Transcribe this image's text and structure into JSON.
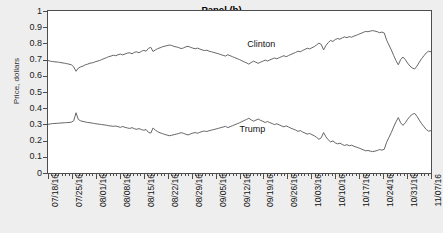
{
  "figure": {
    "panel_title": "Panel (b)",
    "ylabel": "Price, dollars",
    "background_color": "#eeeeee",
    "plot_background_color": "#ffffff",
    "line_color": "#666666",
    "frame_color": "#4d4d4d"
  },
  "chart_data": {
    "type": "line",
    "title": "Panel (b)",
    "xlabel": "",
    "ylabel": "Price, dollars",
    "ylim": [
      0,
      1
    ],
    "yticks": [
      0,
      0.1,
      0.2,
      0.3,
      0.4,
      0.5,
      0.6,
      0.7,
      0.8,
      0.9,
      1
    ],
    "ytick_labels": [
      "0",
      "0.1",
      "0.2",
      "0.3",
      "0.4",
      "0.5",
      "0.6",
      "0.7",
      "0.8",
      "0.9",
      "1"
    ],
    "grid": false,
    "legend_position": "inline-annotation",
    "xtick_labels": [
      "07/18/16",
      "07/25/16",
      "08/01/16",
      "08/08/16",
      "08/15/16",
      "08/22/16",
      "08/29/16",
      "09/05/16",
      "09/12/16",
      "09/19/16",
      "09/26/16",
      "10/03/16",
      "10/10/16",
      "10/17/16",
      "10/24/16",
      "10/31/16",
      "11/07/16"
    ],
    "x_start": "07/18/16",
    "x_end": "11/07/16",
    "x_interval": "daily (ticks), weekly (labels)",
    "series": [
      {
        "name": "Clinton",
        "label_x_frac": 0.52,
        "label_y_value": 0.795,
        "values": [
          0.695,
          0.69,
          0.688,
          0.686,
          0.685,
          0.683,
          0.68,
          0.678,
          0.675,
          0.672,
          0.668,
          0.655,
          0.628,
          0.648,
          0.655,
          0.66,
          0.668,
          0.672,
          0.678,
          0.68,
          0.685,
          0.69,
          0.694,
          0.7,
          0.706,
          0.712,
          0.718,
          0.722,
          0.727,
          0.724,
          0.73,
          0.734,
          0.729,
          0.735,
          0.74,
          0.742,
          0.736,
          0.745,
          0.748,
          0.742,
          0.751,
          0.757,
          0.752,
          0.769,
          0.776,
          0.75,
          0.76,
          0.768,
          0.773,
          0.779,
          0.783,
          0.786,
          0.79,
          0.787,
          0.781,
          0.778,
          0.774,
          0.768,
          0.772,
          0.779,
          0.782,
          0.776,
          0.771,
          0.767,
          0.771,
          0.765,
          0.76,
          0.756,
          0.758,
          0.752,
          0.748,
          0.744,
          0.74,
          0.736,
          0.731,
          0.726,
          0.722,
          0.73,
          0.724,
          0.718,
          0.712,
          0.706,
          0.7,
          0.693,
          0.686,
          0.68,
          0.672,
          0.682,
          0.69,
          0.684,
          0.677,
          0.684,
          0.69,
          0.697,
          0.691,
          0.698,
          0.704,
          0.71,
          0.705,
          0.712,
          0.718,
          0.724,
          0.718,
          0.725,
          0.732,
          0.738,
          0.744,
          0.752,
          0.748,
          0.756,
          0.763,
          0.77,
          0.766,
          0.773,
          0.78,
          0.79,
          0.802,
          0.793,
          0.76,
          0.787,
          0.805,
          0.818,
          0.812,
          0.824,
          0.83,
          0.826,
          0.834,
          0.84,
          0.835,
          0.842,
          0.838,
          0.845,
          0.85,
          0.856,
          0.862,
          0.868,
          0.874,
          0.872,
          0.876,
          0.879,
          0.876,
          0.872,
          0.866,
          0.87,
          0.864,
          0.82,
          0.79,
          0.76,
          0.726,
          0.694,
          0.668,
          0.7,
          0.716,
          0.7,
          0.678,
          0.66,
          0.648,
          0.642,
          0.66,
          0.684,
          0.706,
          0.724,
          0.742,
          0.752,
          0.748
        ]
      },
      {
        "name": "Trump",
        "label_x_frac": 0.5,
        "label_y_value": 0.272,
        "values": [
          0.3,
          0.303,
          0.305,
          0.306,
          0.307,
          0.308,
          0.309,
          0.31,
          0.311,
          0.312,
          0.314,
          0.322,
          0.372,
          0.33,
          0.322,
          0.318,
          0.315,
          0.312,
          0.31,
          0.308,
          0.305,
          0.303,
          0.301,
          0.299,
          0.297,
          0.295,
          0.292,
          0.29,
          0.288,
          0.29,
          0.286,
          0.282,
          0.287,
          0.282,
          0.278,
          0.275,
          0.28,
          0.273,
          0.27,
          0.274,
          0.268,
          0.264,
          0.268,
          0.251,
          0.246,
          0.278,
          0.264,
          0.255,
          0.248,
          0.243,
          0.238,
          0.234,
          0.23,
          0.233,
          0.237,
          0.24,
          0.244,
          0.249,
          0.245,
          0.239,
          0.235,
          0.241,
          0.246,
          0.25,
          0.245,
          0.251,
          0.256,
          0.259,
          0.256,
          0.261,
          0.265,
          0.268,
          0.272,
          0.276,
          0.28,
          0.284,
          0.288,
          0.28,
          0.286,
          0.292,
          0.298,
          0.304,
          0.31,
          0.317,
          0.324,
          0.33,
          0.338,
          0.328,
          0.32,
          0.326,
          0.333,
          0.325,
          0.319,
          0.312,
          0.318,
          0.311,
          0.305,
          0.299,
          0.304,
          0.297,
          0.291,
          0.285,
          0.291,
          0.284,
          0.277,
          0.271,
          0.265,
          0.257,
          0.262,
          0.253,
          0.247,
          0.24,
          0.244,
          0.237,
          0.23,
          0.22,
          0.208,
          0.217,
          0.25,
          0.223,
          0.205,
          0.192,
          0.198,
          0.186,
          0.18,
          0.184,
          0.176,
          0.17,
          0.175,
          0.168,
          0.172,
          0.165,
          0.16,
          0.155,
          0.149,
          0.143,
          0.137,
          0.139,
          0.135,
          0.132,
          0.135,
          0.139,
          0.145,
          0.141,
          0.147,
          0.19,
          0.22,
          0.25,
          0.284,
          0.316,
          0.342,
          0.31,
          0.294,
          0.31,
          0.332,
          0.35,
          0.362,
          0.368,
          0.35,
          0.326,
          0.304,
          0.286,
          0.268,
          0.258,
          0.262
        ]
      }
    ]
  }
}
